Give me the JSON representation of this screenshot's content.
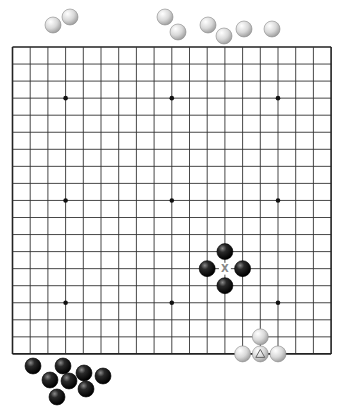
{
  "board": {
    "size": 19,
    "origin": {
      "x": 12.5,
      "y": 47
    },
    "spacing": {
      "x": 17.7,
      "y": 17.05
    },
    "line_color": "#333333",
    "border_color": "#222222",
    "hoshi": [
      [
        3,
        3
      ],
      [
        9,
        3
      ],
      [
        15,
        3
      ],
      [
        3,
        9
      ],
      [
        9,
        9
      ],
      [
        15,
        9
      ],
      [
        3,
        15
      ],
      [
        9,
        15
      ],
      [
        15,
        15
      ]
    ]
  },
  "stones_on_board": [
    {
      "color": "black",
      "col": 12,
      "row": 12
    },
    {
      "color": "black",
      "col": 11,
      "row": 13
    },
    {
      "color": "black",
      "col": 13,
      "row": 13
    },
    {
      "color": "black",
      "col": 12,
      "row": 14
    },
    {
      "color": "white",
      "col": 14,
      "row": 17
    },
    {
      "color": "white",
      "col": 13,
      "row": 18
    },
    {
      "color": "white",
      "col": 14,
      "row": 18,
      "marker": "triangle"
    },
    {
      "color": "white",
      "col": 15,
      "row": 18
    }
  ],
  "markers": [
    {
      "type": "x",
      "col": 12,
      "row": 13,
      "label": "X"
    }
  ],
  "captured_white": [
    {
      "x": 53,
      "y": 25
    },
    {
      "x": 70,
      "y": 17
    },
    {
      "x": 165,
      "y": 17
    },
    {
      "x": 178,
      "y": 32
    },
    {
      "x": 208,
      "y": 25
    },
    {
      "x": 224,
      "y": 36
    },
    {
      "x": 244,
      "y": 29
    },
    {
      "x": 272,
      "y": 29
    }
  ],
  "captured_black": [
    {
      "x": 33,
      "y": 366
    },
    {
      "x": 63,
      "y": 366
    },
    {
      "x": 50,
      "y": 380
    },
    {
      "x": 69,
      "y": 381
    },
    {
      "x": 84,
      "y": 373
    },
    {
      "x": 103,
      "y": 376
    },
    {
      "x": 86,
      "y": 389
    },
    {
      "x": 57,
      "y": 397
    }
  ],
  "stone_radius": 8
}
